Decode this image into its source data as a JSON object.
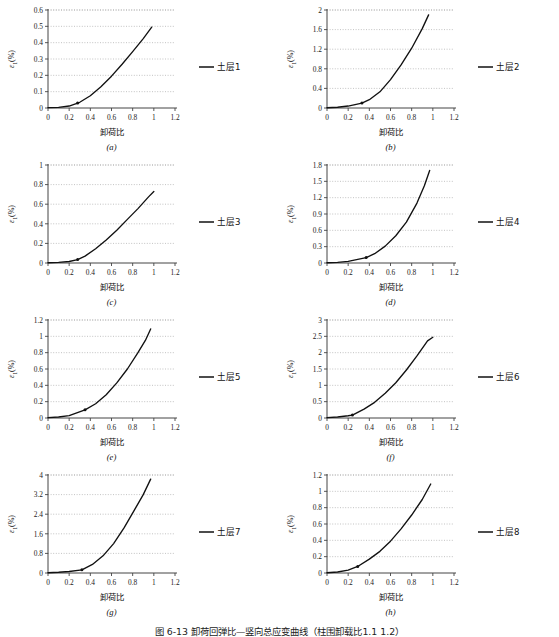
{
  "figure": {
    "caption": "图 6-13  卸荷回弹比—竖向总应变曲线（柱围卸载比1.1 1.2）",
    "axis_x_label": "卸荷比",
    "axis_y_label": "ε₁(%)",
    "line_color": "#111111",
    "grid_color": "#9a9a9a",
    "axis_color": "#444444",
    "background": "#ffffff"
  },
  "chart_data": [
    {
      "type": "line",
      "panel": "(a)",
      "legend": "土层1",
      "xlabel": "卸荷比",
      "ylabel": "ε₁(%)",
      "xlim": [
        0,
        1.2
      ],
      "ylim": [
        0,
        0.6
      ],
      "xticks": [
        "0",
        "0.2",
        "0.4",
        "0.6",
        "0.8",
        "1",
        "1.2"
      ],
      "yticks": [
        "0",
        "0.1",
        "0.2",
        "0.3",
        "0.4",
        "0.5",
        "0.6"
      ],
      "grid": true,
      "legend_position": "right",
      "marker_point": {
        "x": 0.28,
        "y": 0.03
      },
      "x": [
        0,
        0.1,
        0.2,
        0.28,
        0.3,
        0.4,
        0.5,
        0.6,
        0.7,
        0.8,
        0.9,
        0.98
      ],
      "y": [
        0.002,
        0.004,
        0.012,
        0.03,
        0.035,
        0.075,
        0.13,
        0.195,
        0.268,
        0.345,
        0.425,
        0.495
      ]
    },
    {
      "type": "line",
      "panel": "(b)",
      "legend": "土层2",
      "xlabel": "卸荷比",
      "ylabel": "ε₁(%)",
      "xlim": [
        0,
        1.2
      ],
      "ylim": [
        0,
        2
      ],
      "xticks": [
        "0",
        "0.2",
        "0.4",
        "0.6",
        "0.8",
        "1",
        "1.2"
      ],
      "yticks": [
        "0",
        "0.4",
        "0.8",
        "1.2",
        "1.6",
        "2"
      ],
      "grid": true,
      "legend_position": "right",
      "marker_point": {
        "x": 0.33,
        "y": 0.1
      },
      "x": [
        0,
        0.1,
        0.2,
        0.33,
        0.4,
        0.5,
        0.6,
        0.7,
        0.8,
        0.9,
        0.96
      ],
      "y": [
        0.005,
        0.015,
        0.04,
        0.1,
        0.17,
        0.33,
        0.58,
        0.88,
        1.22,
        1.62,
        1.9
      ]
    },
    {
      "type": "line",
      "panel": "(c)",
      "legend": "土层3",
      "xlabel": "卸荷比",
      "ylabel": "ε₁(%)",
      "xlim": [
        0,
        1.2
      ],
      "ylim": [
        0,
        1
      ],
      "xticks": [
        "0",
        "0.2",
        "0.4",
        "0.6",
        "0.8",
        "1",
        "1.2"
      ],
      "yticks": [
        "0",
        "0.2",
        "0.4",
        "0.6",
        "0.8",
        "1"
      ],
      "grid": true,
      "legend_position": "right",
      "marker_point": {
        "x": 0.28,
        "y": 0.035
      },
      "x": [
        0,
        0.1,
        0.2,
        0.28,
        0.35,
        0.45,
        0.55,
        0.65,
        0.75,
        0.85,
        0.95,
        1.0
      ],
      "y": [
        0.003,
        0.006,
        0.015,
        0.035,
        0.07,
        0.145,
        0.235,
        0.335,
        0.445,
        0.555,
        0.675,
        0.73
      ]
    },
    {
      "type": "line",
      "panel": "(d)",
      "legend": "土层4",
      "xlabel": "卸荷比",
      "ylabel": "ε₁(%)",
      "xlim": [
        0,
        1.2
      ],
      "ylim": [
        0,
        1.8
      ],
      "xticks": [
        "0",
        "0.2",
        "0.4",
        "0.6",
        "0.8",
        "1",
        "1.2"
      ],
      "yticks": [
        "0",
        "0.3",
        "0.6",
        "0.9",
        "1.2",
        "1.5",
        "1.8"
      ],
      "grid": true,
      "legend_position": "right",
      "marker_point": {
        "x": 0.37,
        "y": 0.1
      },
      "x": [
        0,
        0.1,
        0.2,
        0.37,
        0.45,
        0.55,
        0.65,
        0.75,
        0.85,
        0.92,
        0.97
      ],
      "y": [
        0.004,
        0.012,
        0.03,
        0.1,
        0.17,
        0.31,
        0.5,
        0.75,
        1.1,
        1.42,
        1.7
      ]
    },
    {
      "type": "line",
      "panel": "(e)",
      "legend": "土层5",
      "xlabel": "卸荷比",
      "ylabel": "ε₁(%)",
      "xlim": [
        0,
        1.2
      ],
      "ylim": [
        0,
        1.2
      ],
      "xticks": [
        "0",
        "0.2",
        "0.4",
        "0.6",
        "0.8",
        "1",
        "1.2"
      ],
      "yticks": [
        "0",
        "0.2",
        "0.4",
        "0.6",
        "0.8",
        "1",
        "1.2"
      ],
      "grid": true,
      "legend_position": "right",
      "marker_point": {
        "x": 0.35,
        "y": 0.1
      },
      "x": [
        0,
        0.1,
        0.2,
        0.35,
        0.45,
        0.55,
        0.65,
        0.75,
        0.85,
        0.92,
        0.97
      ],
      "y": [
        0.004,
        0.012,
        0.03,
        0.1,
        0.175,
        0.285,
        0.43,
        0.6,
        0.8,
        0.95,
        1.09
      ]
    },
    {
      "type": "line",
      "panel": "(f)",
      "legend": "土层6",
      "xlabel": "卸荷比",
      "ylabel": "ε₁(%)",
      "xlim": [
        0,
        1.2
      ],
      "ylim": [
        0,
        3
      ],
      "xticks": [
        "0",
        "0.2",
        "0.4",
        "0.6",
        "0.8",
        "1",
        "1.2"
      ],
      "yticks": [
        "0",
        "0.5",
        "1",
        "1.5",
        "2",
        "2.5",
        "3"
      ],
      "grid": true,
      "legend_position": "right",
      "marker_point": {
        "x": 0.24,
        "y": 0.09
      },
      "x": [
        0,
        0.1,
        0.2,
        0.24,
        0.35,
        0.45,
        0.55,
        0.65,
        0.75,
        0.85,
        0.95,
        1.0
      ],
      "y": [
        0.01,
        0.03,
        0.07,
        0.09,
        0.27,
        0.48,
        0.76,
        1.08,
        1.47,
        1.9,
        2.36,
        2.47
      ]
    },
    {
      "type": "line",
      "panel": "(g)",
      "legend": "土层7",
      "xlabel": "卸荷比",
      "ylabel": "ε₁(%)",
      "xlim": [
        0,
        1.2
      ],
      "ylim": [
        0,
        4
      ],
      "xticks": [
        "0",
        "0.2",
        "0.4",
        "0.6",
        "0.8",
        "1",
        "1.2"
      ],
      "yticks": [
        "0",
        "0.8",
        "1.6",
        "2.4",
        "3.2",
        "4"
      ],
      "grid": true,
      "legend_position": "right",
      "marker_point": {
        "x": 0.32,
        "y": 0.13
      },
      "x": [
        0,
        0.1,
        0.2,
        0.32,
        0.42,
        0.52,
        0.62,
        0.72,
        0.82,
        0.9,
        0.97
      ],
      "y": [
        0.01,
        0.03,
        0.06,
        0.13,
        0.35,
        0.7,
        1.2,
        1.85,
        2.6,
        3.2,
        3.83
      ]
    },
    {
      "type": "line",
      "panel": "(h)",
      "legend": "土层8",
      "xlabel": "卸荷比",
      "ylabel": "ε₁(%)",
      "xlim": [
        0,
        1.2
      ],
      "ylim": [
        0,
        1.2
      ],
      "xticks": [
        "0",
        "0.2",
        "0.4",
        "0.6",
        "0.8",
        "1",
        "1.2"
      ],
      "yticks": [
        "0",
        "0.2",
        "0.4",
        "0.6",
        "0.8",
        "1",
        "1.2"
      ],
      "grid": true,
      "legend_position": "right",
      "marker_point": {
        "x": 0.29,
        "y": 0.08
      },
      "x": [
        0,
        0.1,
        0.2,
        0.29,
        0.4,
        0.5,
        0.6,
        0.7,
        0.8,
        0.9,
        0.98
      ],
      "y": [
        0.003,
        0.012,
        0.035,
        0.08,
        0.17,
        0.265,
        0.39,
        0.54,
        0.71,
        0.9,
        1.09
      ]
    }
  ]
}
